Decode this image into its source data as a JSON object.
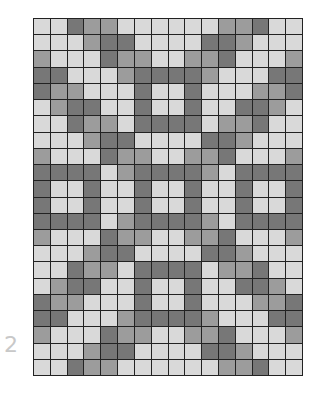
{
  "figure": {
    "label": "2",
    "colors": {
      "L": "#d9d9d9",
      "M": "#9c9c9c",
      "D": "#777777"
    },
    "columns": 16,
    "rows": [
      "LLDMMLLLLLLMMDLL",
      "LLLMDDLLLLDDMLLL",
      "MLLLDMMLLMMDLLLM",
      "DDLLLMDDDDMLLLDD",
      "DMMLLLDLLDLLLMMD",
      "LMDDLLDLLDLLDDML",
      "LLDMMLDDDDLMMDLL",
      "LLLMDDLLLLDDMLLL",
      "MLLLDMMLLMMDLLLM",
      "DDDDLMDDDDMLDDDD",
      "DLLDLLDLLDLLDLLD",
      "DLLDLLDLLDLLDLLD",
      "DDDDLMDDDDMLDDDD",
      "MLLLDMMLLMMDLLLM",
      "LLLMDDLLLLDDMLLL",
      "LLDMMLDDDDLMMDLL",
      "LMDDLLDLLDLLDDML",
      "DMMLLLDLLDLLLMMD",
      "DDLLLMDDDDMLLLDD",
      "MLLLDMMLLMMDLLLM",
      "LLLMDDLLLLDDMLLL",
      "LLDMMLLLLLLMMDLL"
    ]
  }
}
